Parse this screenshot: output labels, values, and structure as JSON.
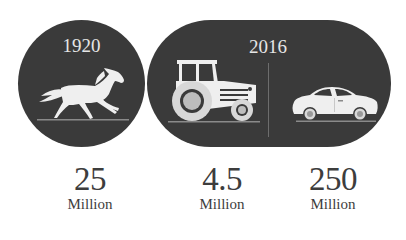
{
  "panels": {
    "left": {
      "year": "1920",
      "icon": "horse-icon"
    },
    "right": {
      "year": "2016",
      "icons": [
        "tractor-icon",
        "car-icon"
      ]
    }
  },
  "stats": [
    {
      "subject": "horse",
      "value": "25",
      "unit": "Million"
    },
    {
      "subject": "tractor",
      "value": "4.5",
      "unit": "Million"
    },
    {
      "subject": "car",
      "value": "250",
      "unit": "Million"
    }
  ],
  "colors": {
    "shape_fill": "#3a3a3a",
    "icon_fill": "#eeeeee",
    "text_dark": "#3d3d3d",
    "year_text": "#e6e6e6"
  }
}
